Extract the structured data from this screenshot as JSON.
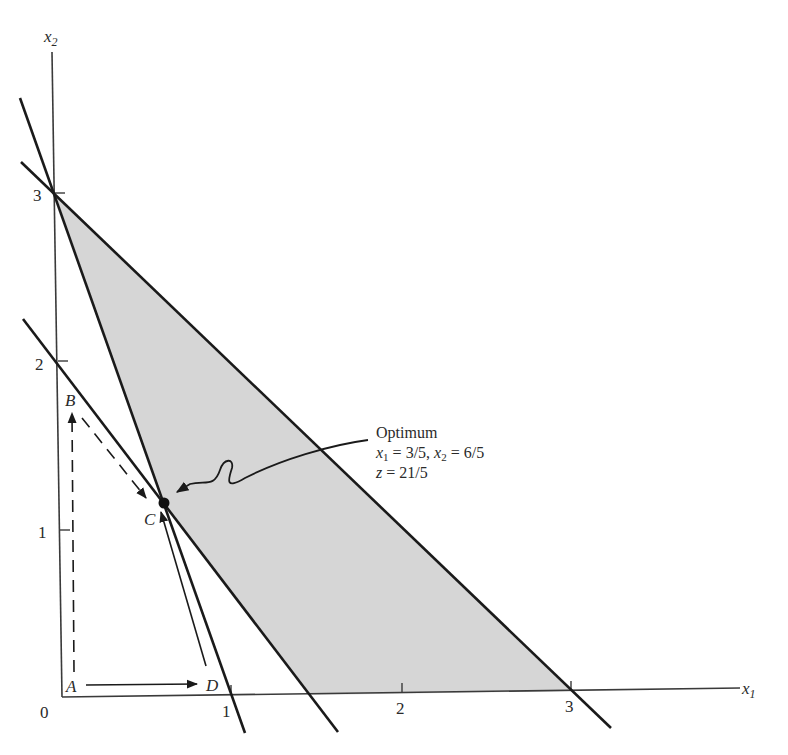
{
  "diagram": {
    "type": "linear-programming-feasible-region",
    "axes": {
      "x_label": "x",
      "x_sub": "1",
      "y_label": "x",
      "y_sub": "2",
      "origin_label": "0",
      "x_ticks": [
        "1",
        "2",
        "3"
      ],
      "y_ticks": [
        "1",
        "2",
        "3"
      ]
    },
    "points": {
      "A": "A",
      "B": "B",
      "C": "C",
      "D": "D"
    },
    "annotation": {
      "title": "Optimum",
      "line1_x1": "x",
      "line1_x1_sub": "1",
      "line1_eq1": " = 3/5, ",
      "line1_x2": "x",
      "line1_x2_sub": "2",
      "line1_eq2": " = 6/5",
      "line2_z": "z",
      "line2_eq": " = 21/5"
    },
    "colors": {
      "feasible_fill": "#d6d6d6",
      "line": "#1a1a1a",
      "axis": "#3a3a3a"
    },
    "constraint_lines": [
      {
        "name": "3x1 + x2 = 3",
        "from": [
          0,
          3
        ],
        "to": [
          1,
          0
        ]
      },
      {
        "name": "4x1 + 3x2 = 6",
        "from": [
          0,
          2
        ],
        "to": [
          1.5,
          0
        ]
      },
      {
        "name": "x1 + x2 = 3",
        "from": [
          0,
          3
        ],
        "to": [
          3,
          0
        ]
      }
    ],
    "feasible_region_vertices": [
      [
        0,
        3
      ],
      [
        0.6,
        1.2
      ],
      [
        1.5,
        0
      ],
      [
        3,
        0
      ]
    ],
    "optimum": {
      "x1": "3/5",
      "x2": "6/5",
      "z": "21/5"
    }
  }
}
